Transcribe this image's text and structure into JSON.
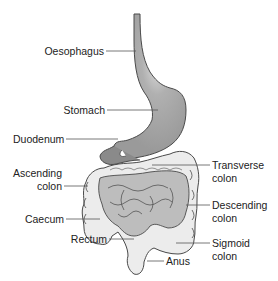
{
  "diagram": {
    "colors": {
      "stomach": "#9e9e9e",
      "stomach_highlight": "#d2d2d2",
      "duodenum": "#8a8a8a",
      "small_intestine": "#bdbdbd",
      "colon": "#ececec",
      "outline": "#4a4a4a",
      "leader_line": "#555555",
      "text": "#222222"
    },
    "labels": {
      "oesophagus": "Oesophagus",
      "stomach": "Stomach",
      "duodenum": "Duodenum",
      "ascending_colon_1": "Ascending",
      "ascending_colon_2": "colon",
      "caecum": "Caecum",
      "rectum": "Rectum",
      "anus": "Anus",
      "transverse_colon_1": "Transverse",
      "transverse_colon_2": "colon",
      "descending_colon_1": "Descending",
      "descending_colon_2": "colon",
      "sigmoid_colon_1": "Sigmoid",
      "sigmoid_colon_2": "colon"
    }
  }
}
